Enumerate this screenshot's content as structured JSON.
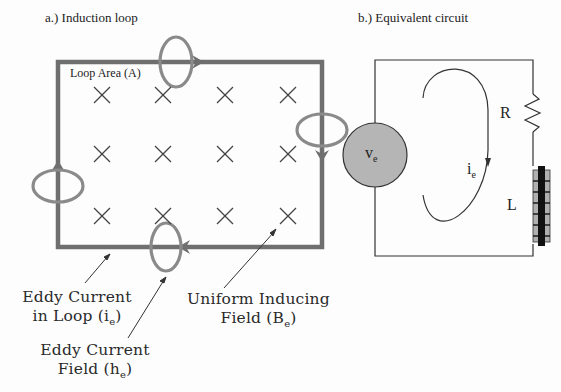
{
  "panel_a": {
    "title": "a.) Induction loop",
    "loop_area_label": "Loop Area (A)",
    "field_symbol": "×",
    "field_grid": {
      "rows": 3,
      "cols": 4
    },
    "callouts": {
      "eddy_current_loop": {
        "line1": "Eddy Current",
        "line2_pre": "in Loop (i",
        "line2_sub": "e",
        "line2_post": ")"
      },
      "eddy_current_field": {
        "line1": "Eddy Current",
        "line2_pre": "Field (h",
        "line2_sub": "e",
        "line2_post": ")"
      },
      "uniform_field": {
        "line1": "Uniform Inducing",
        "line2_pre": "Field (B",
        "line2_sub": "e",
        "line2_post": ")"
      }
    }
  },
  "panel_b": {
    "title": "b.) Equivalent circuit",
    "source_label": "v",
    "source_sub": "e",
    "current_label": "i",
    "current_sub": "e",
    "resistor_label": "R",
    "inductor_label": "L"
  },
  "colors": {
    "loop": "#6f6f6f",
    "field_ring": "#8a8a8a",
    "source_fill": "#b5b5b5",
    "wire": "#333333",
    "inductor_core": "#111111",
    "inductor_winding": "#b0b0b0"
  }
}
